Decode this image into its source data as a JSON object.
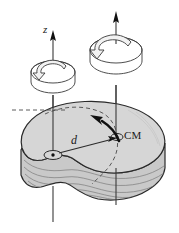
{
  "figure": {
    "type": "physics-diagram",
    "canvas": {
      "width": 179,
      "height": 233,
      "background": "#ffffff"
    },
    "labels": {
      "axis_z": "z",
      "distance": "d",
      "center_of_mass": "CM"
    },
    "colors": {
      "outline": "#2b2b2b",
      "body_top_fill": "#d6d6d6",
      "body_side_fill": "#c9c9c9",
      "hatch_line": "#6f6f6f",
      "axis_line": "#3a3a3a",
      "arrow_fill": "#111111",
      "rotation_symbol_fill": "#f2f2f2",
      "dashed_line": "#4a4a4a"
    },
    "elements": {
      "left_axis_name": "rotation axis through arbitrary point",
      "right_axis_name": "rotation axis through center of mass",
      "left_rotation_symbol": "counterclockwise-rotation-arrow",
      "right_rotation_symbol": "counterclockwise-rotation-arrow",
      "pivot_marker": "axis-piercing-point",
      "cm_marker": "center-of-mass-point",
      "separation_arrow": "distance-vector-d",
      "transfer_arrow": "curved-arrow-cm-to-axis",
      "dashed_guides": "hidden-edge-dashed-lines",
      "shading": "wavy-contour-shading-lines"
    }
  }
}
